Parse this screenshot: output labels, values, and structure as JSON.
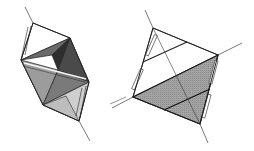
{
  "figure": {
    "panels": [
      {
        "name": "left-polyhedron",
        "kind": "octahedron-like bipyramid with shaded faces",
        "face_colors": [
          "#3c3c3c",
          "#6a6a6a",
          "#9c9c9c",
          "#bdbdbd",
          "#d6d6d6",
          "#ffffff"
        ]
      },
      {
        "name": "right-polyhedron",
        "kind": "tetrahedron with shaded lower face",
        "face_colors": [
          "#9a9a9a",
          "#ffffff"
        ]
      }
    ],
    "colors": {
      "edge": "#222222",
      "axis": "#555555",
      "background": "#ffffff"
    }
  }
}
